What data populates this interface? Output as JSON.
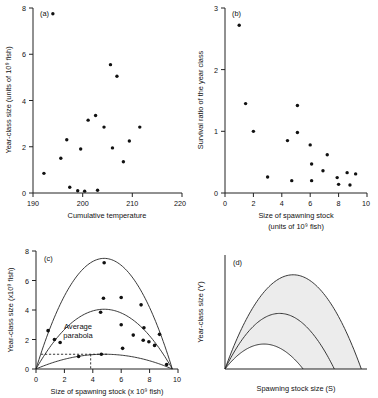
{
  "figure": {
    "width": 378,
    "height": 398,
    "panels": [
      "(a)",
      "(b)",
      "(c)",
      "(d)"
    ]
  },
  "chart_data": [
    {
      "panel": "(a)",
      "type": "scatter",
      "title": "",
      "xlabel": "Cumulative temperature",
      "ylabel": "Year-class size (units of 10⁹ fish)",
      "xlim": [
        190,
        220
      ],
      "ylim": [
        0,
        8
      ],
      "xticks": [
        190,
        200,
        210,
        220
      ],
      "yticks": [
        0,
        2,
        4,
        6,
        8
      ],
      "ytick_labels": [
        "0",
        "2",
        "4",
        "6",
        "8"
      ],
      "xtick_labels": [
        "190",
        "200",
        "210",
        "220"
      ],
      "grid": false,
      "legend": "none",
      "points": [
        {
          "x": 194.0,
          "y": 7.75
        },
        {
          "x": 205.6,
          "y": 5.55
        },
        {
          "x": 206.9,
          "y": 5.05
        },
        {
          "x": 202.6,
          "y": 3.35
        },
        {
          "x": 201.1,
          "y": 3.15
        },
        {
          "x": 204.3,
          "y": 2.85
        },
        {
          "x": 211.5,
          "y": 2.85
        },
        {
          "x": 196.8,
          "y": 2.3
        },
        {
          "x": 209.4,
          "y": 2.25
        },
        {
          "x": 206.0,
          "y": 1.95
        },
        {
          "x": 199.6,
          "y": 1.9
        },
        {
          "x": 195.6,
          "y": 1.5
        },
        {
          "x": 208.2,
          "y": 1.35
        },
        {
          "x": 192.2,
          "y": 0.85
        },
        {
          "x": 197.4,
          "y": 0.25
        },
        {
          "x": 203.0,
          "y": 0.12
        },
        {
          "x": 199.0,
          "y": 0.1
        },
        {
          "x": 200.4,
          "y": 0.08
        }
      ]
    },
    {
      "panel": "(b)",
      "type": "scatter",
      "title": "",
      "xlabel": "Size of spawning stock",
      "xlabel2": "(units of 10⁹ fish)",
      "ylabel": "Survival ratio of the year class",
      "xlim": [
        0,
        10
      ],
      "ylim": [
        0,
        3
      ],
      "xticks": [
        0,
        2,
        4,
        6,
        8,
        10
      ],
      "yticks": [
        0,
        1,
        2,
        3
      ],
      "xtick_labels": [
        "0",
        "2",
        "4",
        "6",
        "8",
        "10"
      ],
      "ytick_labels": [
        "0",
        "1",
        "2",
        "3"
      ],
      "grid": false,
      "legend": "none",
      "points": [
        {
          "x": 1.0,
          "y": 2.72
        },
        {
          "x": 1.45,
          "y": 1.45
        },
        {
          "x": 5.1,
          "y": 1.42
        },
        {
          "x": 2.0,
          "y": 1.0
        },
        {
          "x": 5.1,
          "y": 0.98
        },
        {
          "x": 4.4,
          "y": 0.85
        },
        {
          "x": 6.0,
          "y": 0.78
        },
        {
          "x": 7.2,
          "y": 0.62
        },
        {
          "x": 6.1,
          "y": 0.47
        },
        {
          "x": 6.9,
          "y": 0.36
        },
        {
          "x": 8.6,
          "y": 0.33
        },
        {
          "x": 9.2,
          "y": 0.31
        },
        {
          "x": 3.0,
          "y": 0.26
        },
        {
          "x": 7.9,
          "y": 0.25
        },
        {
          "x": 4.7,
          "y": 0.2
        },
        {
          "x": 6.1,
          "y": 0.2
        },
        {
          "x": 8.0,
          "y": 0.14
        },
        {
          "x": 8.8,
          "y": 0.13
        }
      ]
    },
    {
      "panel": "(c)",
      "type": "scatter",
      "title": "",
      "xlabel": "Size of spawning stock (x 10⁹ fish)",
      "ylabel": "Year-class size (x10⁹ fish)",
      "xlim": [
        0,
        10
      ],
      "ylim": [
        0,
        8
      ],
      "xticks": [
        0,
        2,
        4,
        6,
        8,
        10
      ],
      "yticks": [
        0,
        2,
        4,
        6,
        8
      ],
      "xtick_labels": [
        "0",
        "2",
        "4",
        "6",
        "8",
        "10"
      ],
      "ytick_labels": [
        "0",
        "2",
        "4",
        "6",
        "8"
      ],
      "grid": false,
      "legend": "none",
      "annotation": "Average parabola",
      "annotation_line1": "Average",
      "annotation_line2": "parabola",
      "curves": [
        {
          "name": "upper-parabola",
          "peak_x": 4.8,
          "peak_y": 7.5,
          "x_end": 9.6
        },
        {
          "name": "average-parabola",
          "peak_x": 4.7,
          "peak_y": 4.05,
          "x_end": 9.6
        },
        {
          "name": "lower-parabola",
          "peak_x": 4.6,
          "peak_y": 1.0,
          "x_end": 9.6
        }
      ],
      "dashed_guides": {
        "y_level": 1.0,
        "x_level": 3.85
      },
      "points": [
        {
          "x": 4.8,
          "y": 7.2
        },
        {
          "x": 4.75,
          "y": 4.8
        },
        {
          "x": 6.0,
          "y": 4.85
        },
        {
          "x": 7.4,
          "y": 4.35
        },
        {
          "x": 4.55,
          "y": 3.85
        },
        {
          "x": 6.0,
          "y": 3.0
        },
        {
          "x": 7.6,
          "y": 2.8
        },
        {
          "x": 0.85,
          "y": 2.6
        },
        {
          "x": 6.85,
          "y": 2.3
        },
        {
          "x": 8.7,
          "y": 2.35
        },
        {
          "x": 1.3,
          "y": 2.0
        },
        {
          "x": 7.55,
          "y": 1.95
        },
        {
          "x": 7.95,
          "y": 1.85
        },
        {
          "x": 1.7,
          "y": 1.8
        },
        {
          "x": 8.35,
          "y": 1.6
        },
        {
          "x": 6.1,
          "y": 1.4
        },
        {
          "x": 4.6,
          "y": 1.0
        },
        {
          "x": 3.0,
          "y": 0.85
        },
        {
          "x": 9.2,
          "y": 0.3
        }
      ]
    },
    {
      "panel": "(d)",
      "type": "line",
      "title": "",
      "xlabel": "Spawning stock size (S)",
      "ylabel": "Year-class size (Y)",
      "xlim": [
        0,
        10
      ],
      "ylim": [
        0,
        8
      ],
      "xticks": [],
      "yticks": [],
      "grid": false,
      "legend": "none",
      "shaded_bands": 2,
      "curves": [
        {
          "name": "upper-parabola",
          "peak_x": 4.6,
          "peak_y": 6.6,
          "x_end": 9.6
        },
        {
          "name": "middle-parabola",
          "peak_x": 3.8,
          "peak_y": 3.9,
          "x_end": 7.7
        },
        {
          "name": "lower-parabola",
          "peak_x": 2.7,
          "peak_y": 1.75,
          "x_end": 5.5
        }
      ]
    }
  ]
}
